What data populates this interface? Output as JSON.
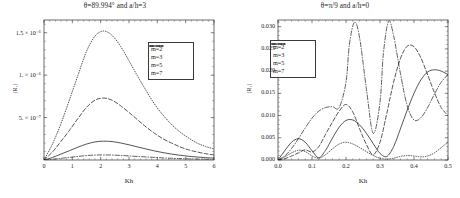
{
  "figure": {
    "panels": [
      "left",
      "right"
    ]
  },
  "chart_data": [
    {
      "id": "left",
      "type": "line",
      "title": "θ=89.994° and a/h=3",
      "xlabel": "Kh",
      "ylabel": "|R₁|",
      "xlim": [
        0,
        6
      ],
      "ylim": [
        0,
        1.65e-06
      ],
      "grid": false,
      "legend_position": "upper-right",
      "xticks": [
        0,
        1,
        2,
        3,
        4,
        5,
        6
      ],
      "xticklabels": [
        "0",
        "1",
        "2",
        "3",
        "4",
        "5",
        "6"
      ],
      "yticks": [
        5e-07,
        1e-06,
        1.5e-06
      ],
      "yticklabels": [
        "5. × 10⁻⁷",
        "1. × 10⁻⁶",
        "1.5 × 10⁻⁶"
      ],
      "series": [
        {
          "name": "m=2",
          "style": "dotted",
          "x": [
            0,
            0.3,
            0.6,
            0.9,
            1.2,
            1.5,
            1.8,
            2.1,
            2.4,
            2.7,
            3.0,
            3.3,
            3.6,
            3.9,
            4.2,
            4.5,
            4.8,
            5.1,
            5.4,
            5.7,
            6.0
          ],
          "y": [
            0,
            1.9e-07,
            4.3e-07,
            7.1e-07,
            1e-06,
            1.28e-06,
            1.46e-06,
            1.52e-06,
            1.47e-06,
            1.34e-06,
            1.17e-06,
            9.9e-07,
            8.2e-07,
            6.6e-07,
            5.3e-07,
            4.2e-07,
            3.3e-07,
            2.6e-07,
            2e-07,
            1.6e-07,
            1.3e-07
          ]
        },
        {
          "name": "m=3",
          "style": "solid",
          "x": [
            0,
            0.3,
            0.6,
            0.9,
            1.2,
            1.5,
            1.8,
            2.1,
            2.4,
            2.7,
            3.0,
            3.3,
            3.6,
            3.9,
            4.2,
            4.5,
            4.8,
            5.1,
            5.4,
            5.7,
            6.0
          ],
          "y": [
            0,
            3e-08,
            7e-08,
            1.1e-07,
            1.52e-07,
            1.88e-07,
            2.13e-07,
            2.22e-07,
            2.17e-07,
            2.01e-07,
            1.79e-07,
            1.54e-07,
            1.3e-07,
            1.07e-07,
            8.7e-08,
            7e-08,
            5.6e-08,
            4.4e-08,
            3.5e-08,
            2.8e-08,
            2.2e-08
          ]
        },
        {
          "name": "m=5",
          "style": "dashed",
          "x": [
            0,
            0.3,
            0.6,
            0.9,
            1.2,
            1.5,
            1.8,
            2.1,
            2.4,
            2.7,
            3.0,
            3.3,
            3.6,
            3.9,
            4.2,
            4.5,
            4.8,
            5.1,
            5.4,
            5.7,
            6.0
          ],
          "y": [
            0,
            9.5e-08,
            2.2e-07,
            3.5e-07,
            4.9e-07,
            6.2e-07,
            7.05e-07,
            7.3e-07,
            7.05e-07,
            6.4e-07,
            5.6e-07,
            4.75e-07,
            3.9e-07,
            3.15e-07,
            2.5e-07,
            2e-07,
            1.55e-07,
            1.2e-07,
            9.5e-08,
            7.5e-08,
            6e-08
          ]
        },
        {
          "name": "m=7",
          "style": "dashdot",
          "x": [
            0,
            0.3,
            0.6,
            0.9,
            1.2,
            1.5,
            1.8,
            2.1,
            2.4,
            2.7,
            3.0,
            3.3,
            3.6,
            3.9,
            4.2,
            4.5,
            4.8,
            5.1,
            5.4,
            5.7,
            6.0
          ],
          "y": [
            0,
            9e-09,
            2e-08,
            3.1e-08,
            4.2e-08,
            5.2e-08,
            5.8e-08,
            6e-08,
            5.8e-08,
            5.4e-08,
            4.8e-08,
            4.2e-08,
            3.6e-08,
            3e-08,
            2.5e-08,
            2e-08,
            1.7e-08,
            1.4e-08,
            1.1e-08,
            9e-09,
            7e-09
          ]
        }
      ],
      "legend": [
        {
          "label": "m=2",
          "style": "dotted"
        },
        {
          "label": "m=3",
          "style": "solid"
        },
        {
          "label": "m=5",
          "style": "dashed"
        },
        {
          "label": "m=7",
          "style": "dashdot"
        }
      ]
    },
    {
      "id": "right",
      "type": "line",
      "title": "θ=π/9 and a/h=0",
      "xlabel": "Kh",
      "ylabel": "|R₁|",
      "xlim": [
        0,
        0.5
      ],
      "ylim": [
        0,
        0.0315
      ],
      "grid": false,
      "legend_position": "upper-left",
      "xticks": [
        0.0,
        0.1,
        0.2,
        0.3,
        0.4,
        0.5
      ],
      "xticklabels": [
        "0.0",
        "0.1",
        "0.2",
        "0.3",
        "0.4",
        "0.5"
      ],
      "yticks": [
        0.0,
        0.005,
        0.01,
        0.015,
        0.02,
        0.025,
        0.03
      ],
      "yticklabels": [
        "0.000",
        "0.005",
        "0.010",
        "0.015",
        "0.020",
        "0.025",
        "0.030"
      ],
      "series": [
        {
          "name": "m=2",
          "style": "dotted",
          "x": [
            0.0,
            0.02,
            0.04,
            0.06,
            0.08,
            0.1,
            0.12,
            0.14,
            0.16,
            0.18,
            0.2,
            0.22,
            0.24,
            0.26,
            0.28,
            0.3,
            0.32,
            0.34,
            0.36,
            0.38,
            0.4,
            0.42,
            0.44,
            0.46,
            0.48,
            0.5
          ],
          "y": [
            0.0,
            0.0007,
            0.0016,
            0.0022,
            0.0019,
            0.0009,
            0.0004,
            0.0012,
            0.0025,
            0.0036,
            0.004,
            0.0036,
            0.0028,
            0.0019,
            0.001,
            0.0004,
            0.0002,
            0.0004,
            0.0008,
            0.001,
            0.0009,
            0.0007,
            0.0009,
            0.0016,
            0.0028,
            0.004
          ]
        },
        {
          "name": "m=3",
          "style": "solid",
          "x": [
            0.0,
            0.02,
            0.04,
            0.06,
            0.08,
            0.1,
            0.12,
            0.14,
            0.16,
            0.18,
            0.2,
            0.22,
            0.24,
            0.26,
            0.28,
            0.3,
            0.32,
            0.34,
            0.36,
            0.38,
            0.4,
            0.42,
            0.44,
            0.46,
            0.48,
            0.5
          ],
          "y": [
            0.0,
            0.0021,
            0.004,
            0.0048,
            0.004,
            0.0021,
            0.0005,
            0.0022,
            0.0049,
            0.0074,
            0.0089,
            0.009,
            0.0079,
            0.006,
            0.0037,
            0.0015,
            0.0008,
            0.003,
            0.007,
            0.0112,
            0.015,
            0.018,
            0.0198,
            0.0203,
            0.02,
            0.0192
          ]
        },
        {
          "name": "m=5",
          "style": "dashed",
          "x": [
            0.0,
            0.02,
            0.04,
            0.06,
            0.08,
            0.1,
            0.12,
            0.14,
            0.16,
            0.18,
            0.2,
            0.22,
            0.24,
            0.26,
            0.28,
            0.3,
            0.32,
            0.34,
            0.36,
            0.38,
            0.4,
            0.42,
            0.44,
            0.46,
            0.48,
            0.5
          ],
          "y": [
            0.0,
            0.0003,
            0.0009,
            0.0016,
            0.0023,
            0.0018,
            0.003,
            0.0058,
            0.0085,
            0.011,
            0.0125,
            0.0108,
            0.007,
            0.0035,
            0.0012,
            0.004,
            0.0105,
            0.0175,
            0.0228,
            0.0256,
            0.0255,
            0.023,
            0.0192,
            0.0152,
            0.0118,
            0.01
          ]
        },
        {
          "name": "m=7",
          "style": "dashdot",
          "x": [
            0.0,
            0.02,
            0.04,
            0.06,
            0.08,
            0.1,
            0.12,
            0.14,
            0.16,
            0.18,
            0.2,
            0.21,
            0.225,
            0.24,
            0.26,
            0.28,
            0.3,
            0.31,
            0.325,
            0.34,
            0.36,
            0.38,
            0.4,
            0.42,
            0.44,
            0.46,
            0.48,
            0.5
          ],
          "y": [
            0.0,
            0.0009,
            0.0026,
            0.0048,
            0.0072,
            0.0094,
            0.011,
            0.0118,
            0.012,
            0.0118,
            0.0175,
            0.026,
            0.031,
            0.0275,
            0.016,
            0.006,
            0.013,
            0.024,
            0.0312,
            0.028,
            0.0195,
            0.0122,
            0.009,
            0.0095,
            0.0118,
            0.0148,
            0.0175,
            0.0192
          ]
        }
      ],
      "legend": [
        {
          "label": "m=2",
          "style": "dotted"
        },
        {
          "label": "m=3",
          "style": "solid"
        },
        {
          "label": "m=5",
          "style": "dashed"
        },
        {
          "label": "m=7",
          "style": "dashdot"
        }
      ]
    }
  ]
}
